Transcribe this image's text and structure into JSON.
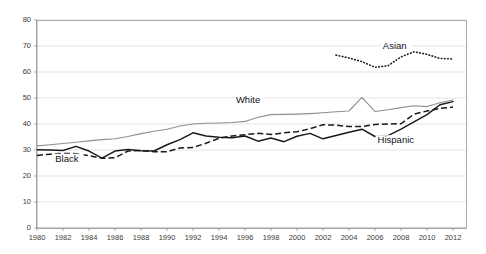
{
  "chart_data": {
    "type": "line",
    "title": "",
    "xlabel": "",
    "ylabel": "",
    "xlim": [
      1980,
      2013
    ],
    "ylim": [
      0,
      80
    ],
    "yticks": [
      0,
      10,
      20,
      30,
      40,
      50,
      60,
      70,
      80
    ],
    "xticks": [
      1980,
      1982,
      1984,
      1986,
      1988,
      1990,
      1992,
      1994,
      1996,
      1998,
      2000,
      2002,
      2004,
      2006,
      2008,
      2010,
      2012
    ],
    "grid": true,
    "legend_position": "inline-annotations",
    "colors": {
      "white": "#8f8f8f",
      "black": "#1a1a1a",
      "hispanic": "#1a1a1a",
      "asian": "#1a1a1a",
      "gridline": "#d9d9d9",
      "frame": "#9a9a9a",
      "text": "#3a3a3a"
    },
    "series": [
      {
        "name": "White",
        "style": "solid-gray",
        "x": [
          1980,
          1981,
          1982,
          1983,
          1984,
          1985,
          1986,
          1987,
          1988,
          1989,
          1990,
          1991,
          1992,
          1993,
          1994,
          1995,
          1996,
          1997,
          1998,
          1999,
          2000,
          2001,
          2002,
          2003,
          2004,
          2005,
          2006,
          2007,
          2008,
          2009,
          2010,
          2011,
          2012
        ],
        "values": [
          31.6,
          32.0,
          32.5,
          33.0,
          33.5,
          34.0,
          34.3,
          35.2,
          36.3,
          37.2,
          38.0,
          39.2,
          40.0,
          40.3,
          40.4,
          40.6,
          41.0,
          42.6,
          43.6,
          43.7,
          43.8,
          44.0,
          44.3,
          44.7,
          45.0,
          50.2,
          44.8,
          45.5,
          46.3,
          47.0,
          46.7,
          48.2,
          49.2
        ]
      },
      {
        "name": "Black",
        "style": "dashed",
        "x": [
          1980,
          1981,
          1982,
          1983,
          1984,
          1985,
          1986,
          1987,
          1988,
          1989,
          1990,
          1991,
          1992,
          1993,
          1994,
          1995,
          1996,
          1997,
          1998,
          1999,
          2000,
          2001,
          2002,
          2003,
          2004,
          2005,
          2006,
          2007,
          2008,
          2009,
          2010,
          2011,
          2012
        ],
        "values": [
          27.9,
          28.4,
          28.7,
          28.6,
          27.8,
          26.8,
          27.0,
          29.6,
          29.8,
          29.3,
          29.3,
          30.8,
          31.0,
          32.6,
          34.5,
          35.4,
          35.9,
          36.4,
          36.0,
          36.6,
          37.0,
          38.2,
          39.7,
          39.6,
          39.0,
          39.0,
          39.8,
          40.0,
          40.1,
          43.8,
          45.0,
          46.0,
          46.5
        ]
      },
      {
        "name": "Hispanic",
        "style": "solid-black",
        "x": [
          1980,
          1981,
          1982,
          1983,
          1984,
          1985,
          1986,
          1987,
          1988,
          1989,
          1990,
          1991,
          1992,
          1993,
          1994,
          1995,
          1996,
          1997,
          1998,
          1999,
          2000,
          2001,
          2002,
          2003,
          2004,
          2005,
          2006,
          2007,
          2008,
          2009,
          2010,
          2011,
          2012
        ],
        "values": [
          30.1,
          30.0,
          29.8,
          31.4,
          29.6,
          26.9,
          29.6,
          30.2,
          29.7,
          29.6,
          32.0,
          34.0,
          36.6,
          35.4,
          34.9,
          34.7,
          35.4,
          33.4,
          34.6,
          33.2,
          35.3,
          36.4,
          34.3,
          35.6,
          36.8,
          38.0,
          35.2,
          35.5,
          38.0,
          40.8,
          43.6,
          47.4,
          48.6
        ]
      },
      {
        "name": "Asian",
        "style": "dotted",
        "x": [
          2003,
          2004,
          2005,
          2006,
          2007,
          2008,
          2009,
          2010,
          2011,
          2012
        ],
        "values": [
          66.5,
          65.4,
          64.0,
          61.8,
          62.4,
          65.8,
          67.8,
          66.8,
          65.2,
          65.0
        ]
      }
    ],
    "annotations": [
      {
        "text": "White",
        "x": 1995.3,
        "y": 48.0
      },
      {
        "text": "Black",
        "x": 1981.4,
        "y": 25.5
      },
      {
        "text": "Hispanic",
        "x": 2006.2,
        "y": 32.6
      },
      {
        "text": "Asian",
        "x": 2006.6,
        "y": 69.0
      }
    ]
  }
}
